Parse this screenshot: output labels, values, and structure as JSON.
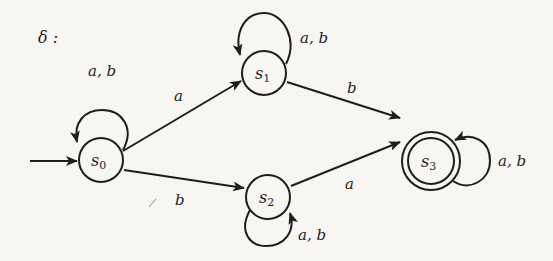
{
  "diagram": {
    "type": "finite-automaton",
    "title": "δ :",
    "states": [
      {
        "id": "s0",
        "name": "s",
        "sub": "0",
        "initial": true,
        "accepting": false
      },
      {
        "id": "s1",
        "name": "s",
        "sub": "1",
        "initial": false,
        "accepting": false
      },
      {
        "id": "s2",
        "name": "s",
        "sub": "2",
        "initial": false,
        "accepting": false
      },
      {
        "id": "s3",
        "name": "s",
        "sub": "3",
        "initial": false,
        "accepting": true
      }
    ],
    "transitions": [
      {
        "from": "s0",
        "to": "s0",
        "label": "a, b"
      },
      {
        "from": "s0",
        "to": "s1",
        "label": "a"
      },
      {
        "from": "s0",
        "to": "s2",
        "label": "b"
      },
      {
        "from": "s1",
        "to": "s1",
        "label": "a, b"
      },
      {
        "from": "s1",
        "to": "s3",
        "label": "b"
      },
      {
        "from": "s2",
        "to": "s2",
        "label": "a, b"
      },
      {
        "from": "s2",
        "to": "s3",
        "label": "a"
      },
      {
        "from": "s3",
        "to": "s3",
        "label": "a, b"
      }
    ],
    "labels": {
      "loop_s0": "a, b",
      "s0_s1": "a",
      "s0_s2": "b",
      "loop_s1": "a, b",
      "s1_s3": "b",
      "loop_s2": "a, b",
      "s2_s3": "a",
      "loop_s3": "a, b"
    }
  }
}
